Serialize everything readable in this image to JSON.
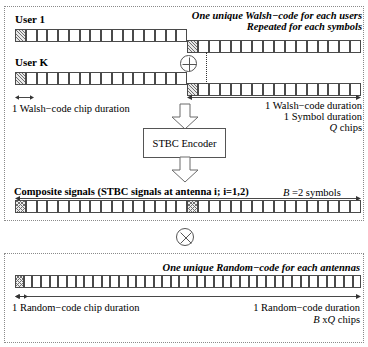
{
  "diagram": {
    "stroke_color": "#4a4a4a",
    "panel_border_color": "#8a8a8a"
  },
  "top_panel": {
    "user1_label": "User 1",
    "userk_label": "User K",
    "note_unique_walsh": "One unique Walsh−code for each users",
    "note_repeated": "Repeated for each symbols",
    "chip_duration_label": "1 Walsh−code chip duration",
    "walsh_duration_label": "1 Walsh−code duration",
    "symbol_duration_label": "1 Symbol duration",
    "q_chips_italic": "Q",
    "q_chips_rest": " chips",
    "xor_operator": "circle-plus",
    "rows": {
      "user1_left_cells": 16,
      "user1_right_cells": 16,
      "userk_left_cells": 16,
      "userk_right_cells": 16
    }
  },
  "encoder": {
    "box_label": "STBC Encoder",
    "arrow_in": "block-arrow-down",
    "arrow_out": "block-arrow-down"
  },
  "composite": {
    "label": "Composite signals (STBC signals at antenna i; i=1,2)",
    "b_symbols_italic": "B",
    "b_symbols_rest": " =2 symbols",
    "row1_cells": 16,
    "row2_cells": 16
  },
  "multiply": {
    "operator": "circle-times"
  },
  "bottom_panel": {
    "note_unique_random": "One unique Random−code for each antennas",
    "chip_duration_label": "1 Random−code chip duration",
    "random_duration_label": "1 Random−code duration",
    "bq_chips_b": "B",
    "bq_chips_x": " x",
    "bq_chips_q": "Q",
    "bq_chips_rest": " chips",
    "row_cells": 40
  }
}
